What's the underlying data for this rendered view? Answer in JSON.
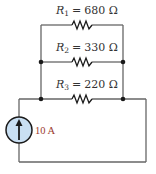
{
  "diagram": {
    "type": "circuit",
    "colors": {
      "wire": "#666666",
      "node": "#1a1a1a",
      "source_fill": "#c9dff2",
      "source_stroke": "#1a1a1a",
      "source_label": "#9b3a2e"
    },
    "resistors": [
      {
        "symbol": "R",
        "subscript": "1",
        "equals": "=",
        "value": "680 Ω"
      },
      {
        "symbol": "R",
        "subscript": "2",
        "equals": "=",
        "value": "330 Ω"
      },
      {
        "symbol": "R",
        "subscript": "3",
        "equals": "=",
        "value": "220 Ω"
      }
    ],
    "source": {
      "kind": "current-source",
      "direction": "up",
      "label": "10 A"
    },
    "nodes": 4
  }
}
